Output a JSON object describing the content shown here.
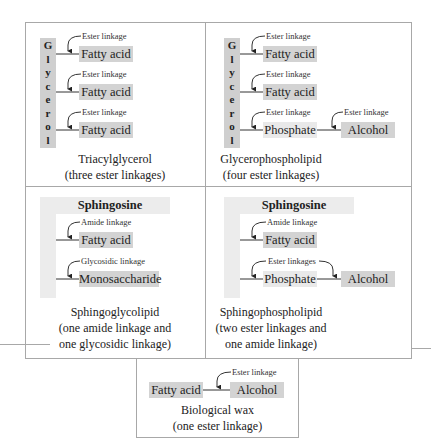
{
  "panels": {
    "triacylglycerol": {
      "backbone_letters": [
        "G",
        "l",
        "y",
        "c",
        "e",
        "r",
        "o",
        "l"
      ],
      "rows": [
        {
          "linkage": "Ester linkage",
          "group": "Fatty acid"
        },
        {
          "linkage": "Ester linkage",
          "group": "Fatty acid"
        },
        {
          "linkage": "Ester linkage",
          "group": "Fatty acid"
        }
      ],
      "caption_line1": "Triacylglycerol",
      "caption_line2": "(three ester linkages)"
    },
    "glycerophospholipid": {
      "backbone_letters": [
        "G",
        "l",
        "y",
        "c",
        "e",
        "r",
        "o",
        "l"
      ],
      "rows": [
        {
          "linkage": "Ester linkage",
          "group": "Fatty acid"
        },
        {
          "linkage": "Ester linkage",
          "group": "Fatty acid"
        },
        {
          "linkage": "Ester linkage",
          "group": "Phosphate",
          "linkage2": "Ester linkage",
          "group2": "Alcohol"
        }
      ],
      "caption_line1": "Glycerophospholipid",
      "caption_line2": "(four ester linkages)"
    },
    "sphingoglycolipid": {
      "backbone": "Sphingosine",
      "rows": [
        {
          "linkage": "Amide linkage",
          "group": "Fatty acid"
        },
        {
          "linkage": "Glycosidic linkage",
          "group": "Monosaccharide"
        }
      ],
      "caption_line1": "Sphingoglycolipid",
      "caption_line2": "(one amide linkage and",
      "caption_line3": "one glycosidic linkage)"
    },
    "sphingophospholipid": {
      "backbone": "Sphingosine",
      "rows": [
        {
          "linkage": "Amide linkage",
          "group": "Fatty acid"
        },
        {
          "linkage": "Ester linkages",
          "group": "Phosphate",
          "group2": "Alcohol"
        }
      ],
      "caption_line1": "Sphingophospholipid",
      "caption_line2": "(two ester linkages and",
      "caption_line3": "one amide linkage)"
    },
    "biological_wax": {
      "group1": "Fatty acid",
      "linkage": "Ester linkage",
      "group2": "Alcohol",
      "caption_line1": "Biological wax",
      "caption_line2": "(one ester linkage)"
    }
  },
  "colors": {
    "box_fill": "#d3d3d3",
    "backbone_fill": "#cfcfcf",
    "sphingosine_fill": "#ececec",
    "border": "#a8a8a8",
    "line": "#333333"
  }
}
